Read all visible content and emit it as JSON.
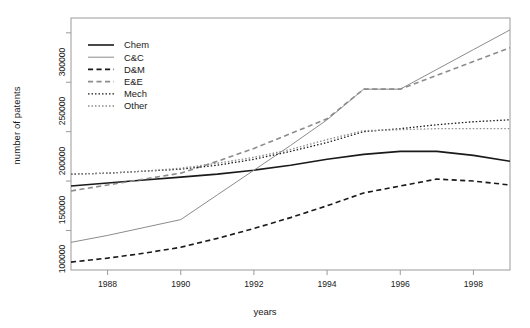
{
  "chart_data": {
    "type": "line",
    "title": "",
    "xlabel": "years",
    "ylabel": "number of patents",
    "xlim": [
      1987,
      1999
    ],
    "ylim": [
      60000,
      315000
    ],
    "grid": false,
    "legend_position": "top-left",
    "x": [
      1987,
      1988,
      1989,
      1990,
      1991,
      1992,
      1993,
      1994,
      1995,
      1996,
      1997,
      1998,
      1999
    ],
    "xticks": [
      1988,
      1990,
      1992,
      1994,
      1996,
      1998
    ],
    "xtick_labels": [
      "1988",
      "1990",
      "1992",
      "1994",
      "1996",
      "1998"
    ],
    "yticks": [
      100000,
      150000,
      200000,
      250000,
      300000
    ],
    "ytick_labels": [
      "100000",
      "150000",
      "200000",
      "250000",
      "300000"
    ],
    "series": [
      {
        "name": "Chem",
        "style": "solid",
        "color": "#1a1a1a",
        "width": 1.6,
        "values": [
          145000,
          148000,
          151000,
          154000,
          157000,
          161000,
          166000,
          172000,
          177000,
          180000,
          180000,
          176000,
          170000
        ]
      },
      {
        "name": "C&C",
        "style": "solid",
        "color": "#8c8c8c",
        "width": 1.0,
        "values": [
          88000,
          95000,
          103000,
          111000,
          136000,
          161000,
          186000,
          212000,
          243000,
          243000,
          263000,
          283000,
          303000
        ]
      },
      {
        "name": "D&M",
        "style": "dashed",
        "color": "#1a1a1a",
        "width": 1.6,
        "values": [
          68000,
          72000,
          77000,
          83000,
          92000,
          102000,
          113000,
          125000,
          138000,
          145000,
          152000,
          150000,
          146000
        ]
      },
      {
        "name": "E&E",
        "style": "dashed",
        "color": "#8c8c8c",
        "width": 1.6,
        "values": [
          140000,
          146000,
          152000,
          158000,
          170000,
          183000,
          198000,
          213000,
          243000,
          243000,
          257000,
          271000,
          285000
        ]
      },
      {
        "name": "Mech",
        "style": "dotted",
        "color": "#1a1a1a",
        "width": 1.3,
        "values": [
          157000,
          158000,
          160000,
          162000,
          166000,
          172000,
          180000,
          189000,
          200000,
          203000,
          207000,
          210000,
          212000
        ]
      },
      {
        "name": "Other",
        "style": "dotted",
        "color": "#8c8c8c",
        "width": 1.3,
        "values": [
          157000,
          158000,
          160000,
          163000,
          168000,
          174000,
          182000,
          192000,
          201000,
          202000,
          203000,
          203000,
          203000
        ]
      }
    ]
  },
  "axes": {
    "ylabel": "number of patents",
    "xlabel": "years"
  }
}
